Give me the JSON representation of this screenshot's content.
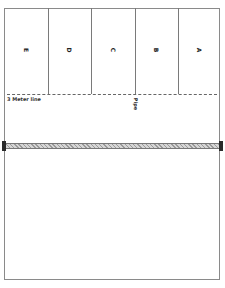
{
  "diagram": {
    "columns": [
      {
        "label": "E"
      },
      {
        "label": "D"
      },
      {
        "label": "C"
      },
      {
        "label": "B"
      },
      {
        "label": "A"
      }
    ],
    "meter_line": {
      "label": "3 Meter line"
    },
    "pipe": {
      "label": "Pipe"
    },
    "colors": {
      "border": "#8a8a8a",
      "divider": "#7a7a7a",
      "dashed_line": "#666666",
      "pipe_fill": "#bbbbbb",
      "pipe_cap": "#2a2a2a"
    }
  }
}
